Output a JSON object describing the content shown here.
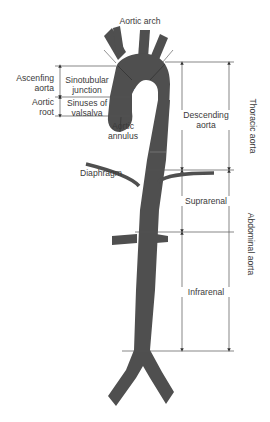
{
  "diagram": {
    "colors": {
      "vessel": "#4f4f4f",
      "vessel_edge": "#3c3c3c",
      "line": "#555555",
      "text": "#3a3a3a"
    },
    "labels": {
      "aortic_arch": "Aortic arch",
      "ascending_aorta_l1": "Ascenfing",
      "ascending_aorta_l2": "aorta",
      "sinotubular_l1": "Sinotubular",
      "sinotubular_l2": "junction",
      "aortic_root_l1": "Aortic",
      "aortic_root_l2": "root",
      "sinuses_l1": "Sinuses of",
      "sinuses_l2": "valsalva",
      "rpa": "rPA",
      "aortic_annulus_l1": "Aortic",
      "aortic_annulus_l2": "annulus",
      "descending_l1": "Descending",
      "descending_l2": "aorta",
      "thoracic": "Thoracic aorta",
      "diaphragm": "Diaphragm",
      "suprarenal": "Suprarenal",
      "abdominal": "Abdominal aorta",
      "infrarenal": "Infrarenal"
    }
  }
}
